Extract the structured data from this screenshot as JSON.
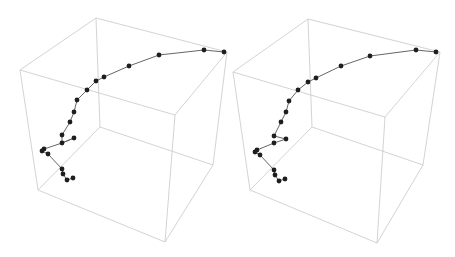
{
  "chart_data": [
    {
      "type": "scatter3d",
      "title": "",
      "panel": "left",
      "axes_visible": false,
      "box": true,
      "line_color": "#555555",
      "marker_color": "#1e1e1e",
      "box_color": "#c8c8c8",
      "box_vertices_px": {
        "back_top_left": [
          96,
          18
        ],
        "back_top_right": [
          227,
          52
        ],
        "front_top_left": [
          20,
          70
        ],
        "front_top_right": [
          175,
          115
        ],
        "back_bottom_left": [
          100,
          127
        ],
        "back_bottom_right": [
          213,
          165
        ],
        "front_bottom_left": [
          38,
          190
        ],
        "front_bottom_right": [
          165,
          242
        ]
      },
      "points_px": [
        [
          224,
          52
        ],
        [
          204,
          50
        ],
        [
          159,
          55
        ],
        [
          129,
          66
        ],
        [
          104,
          77
        ],
        [
          96,
          81
        ],
        [
          87,
          90
        ],
        [
          77,
          100
        ],
        [
          74,
          112
        ],
        [
          70,
          122
        ],
        [
          62,
          135
        ],
        [
          74,
          138
        ],
        [
          62,
          143
        ],
        [
          44,
          149
        ],
        [
          42,
          151
        ],
        [
          48,
          154
        ],
        [
          62,
          169
        ],
        [
          63,
          174
        ],
        [
          67,
          180
        ],
        [
          73,
          178
        ]
      ],
      "path_order": [
        0,
        1,
        2,
        3,
        4,
        5,
        6,
        7,
        8,
        9,
        10,
        12,
        11,
        12,
        13,
        14,
        15,
        16,
        17,
        18,
        19
      ]
    },
    {
      "type": "scatter3d",
      "title": "",
      "panel": "right",
      "axes_visible": false,
      "box": true,
      "line_color": "#555555",
      "marker_color": "#1e1e1e",
      "box_color": "#c8c8c8",
      "box_vertices_px": {
        "back_top_left": [
          308,
          19
        ],
        "back_top_right": [
          440,
          52
        ],
        "front_top_left": [
          233,
          72
        ],
        "front_top_right": [
          385,
          117
        ],
        "back_bottom_left": [
          312,
          127
        ],
        "back_bottom_right": [
          423,
          165
        ],
        "front_bottom_left": [
          250,
          190
        ],
        "front_bottom_right": [
          377,
          243
        ]
      },
      "points_px": [
        [
          436,
          52
        ],
        [
          416,
          50
        ],
        [
          370,
          56
        ],
        [
          341,
          66
        ],
        [
          316,
          78
        ],
        [
          308,
          82
        ],
        [
          298,
          90
        ],
        [
          289,
          101
        ],
        [
          286,
          112
        ],
        [
          281,
          122
        ],
        [
          274,
          136
        ],
        [
          286,
          139
        ],
        [
          274,
          143
        ],
        [
          257,
          150
        ],
        [
          255,
          152
        ],
        [
          260,
          155
        ],
        [
          274,
          170
        ],
        [
          275,
          175
        ],
        [
          279,
          181
        ],
        [
          285,
          179
        ]
      ],
      "path_order": [
        0,
        1,
        2,
        3,
        4,
        5,
        6,
        7,
        8,
        9,
        10,
        11,
        12,
        13,
        14,
        15,
        16,
        17,
        18,
        19
      ]
    }
  ]
}
